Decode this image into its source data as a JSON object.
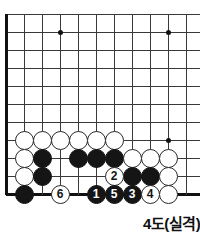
{
  "diagram": {
    "kind": "go-board-problem",
    "caption": "4도(실격)",
    "geometry": {
      "cell": 18,
      "origin_x": 6,
      "origin_y": 14,
      "stone_size": 19,
      "cols": 11,
      "rows": 11
    },
    "grid": {
      "h_lines_y": [
        14,
        32,
        50,
        68,
        86,
        104,
        122,
        140,
        158,
        176,
        194
      ],
      "v_lines_x": [
        6,
        24,
        42,
        60,
        78,
        96,
        114,
        132,
        150,
        168,
        186
      ],
      "left_edge_x": 6,
      "bottom_edge_y": 194,
      "line_color": "#3a3a3a",
      "edge_color": "#111111"
    },
    "star_points": [
      {
        "x": 60,
        "y": 32
      },
      {
        "x": 168,
        "y": 32
      },
      {
        "x": 168,
        "y": 140
      }
    ],
    "stones": [
      {
        "color": "white",
        "x": 24,
        "y": 140,
        "label": ""
      },
      {
        "color": "white",
        "x": 42,
        "y": 140,
        "label": ""
      },
      {
        "color": "white",
        "x": 60,
        "y": 140,
        "label": ""
      },
      {
        "color": "white",
        "x": 78,
        "y": 140,
        "label": ""
      },
      {
        "color": "white",
        "x": 96,
        "y": 140,
        "label": ""
      },
      {
        "color": "white",
        "x": 114,
        "y": 140,
        "label": ""
      },
      {
        "color": "white",
        "x": 24,
        "y": 158,
        "label": ""
      },
      {
        "color": "black",
        "x": 42,
        "y": 158,
        "label": ""
      },
      {
        "color": "black",
        "x": 78,
        "y": 158,
        "label": ""
      },
      {
        "color": "black",
        "x": 96,
        "y": 158,
        "label": ""
      },
      {
        "color": "black",
        "x": 114,
        "y": 158,
        "label": ""
      },
      {
        "color": "white",
        "x": 132,
        "y": 158,
        "label": ""
      },
      {
        "color": "white",
        "x": 150,
        "y": 158,
        "label": ""
      },
      {
        "color": "white",
        "x": 168,
        "y": 158,
        "label": ""
      },
      {
        "color": "white",
        "x": 24,
        "y": 176,
        "label": ""
      },
      {
        "color": "black",
        "x": 42,
        "y": 176,
        "label": ""
      },
      {
        "color": "white",
        "x": 114,
        "y": 176,
        "label": "2"
      },
      {
        "color": "black",
        "x": 132,
        "y": 176,
        "label": ""
      },
      {
        "color": "black",
        "x": 150,
        "y": 176,
        "label": ""
      },
      {
        "color": "white",
        "x": 168,
        "y": 176,
        "label": ""
      },
      {
        "color": "black",
        "x": 24,
        "y": 194,
        "label": ""
      },
      {
        "color": "white",
        "x": 60,
        "y": 194,
        "label": "6"
      },
      {
        "color": "black",
        "x": 96,
        "y": 194,
        "label": "1"
      },
      {
        "color": "black",
        "x": 114,
        "y": 194,
        "label": "5"
      },
      {
        "color": "black",
        "x": 132,
        "y": 194,
        "label": "3"
      },
      {
        "color": "white",
        "x": 150,
        "y": 194,
        "label": "4"
      },
      {
        "color": "white",
        "x": 168,
        "y": 194,
        "label": ""
      }
    ],
    "caption_pos": {
      "x": 143,
      "y": 212
    }
  }
}
